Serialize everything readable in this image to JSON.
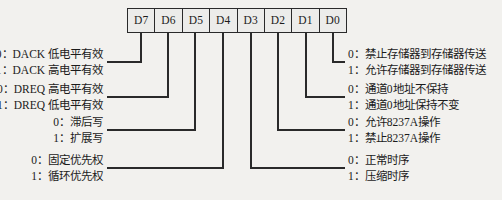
{
  "diagram": {
    "register": {
      "name": "command-register",
      "bits": [
        {
          "label": "D7"
        },
        {
          "label": "D6"
        },
        {
          "label": "D5"
        },
        {
          "label": "D4"
        },
        {
          "label": "D3"
        },
        {
          "label": "D2"
        },
        {
          "label": "D1"
        },
        {
          "label": "D0"
        }
      ]
    },
    "annotations_left": [
      {
        "bit": "D7",
        "line0": "0：DACK 低电平有效",
        "line1": "1：DACK 高电平有效"
      },
      {
        "bit": "D6",
        "line0": "0：DREQ 高电平有效",
        "line1": "1：DREQ 低电平有效"
      },
      {
        "bit": "D5",
        "line0": "0：滞后写",
        "line1": "1：扩展写"
      },
      {
        "bit": "D4",
        "line0": "0：固定优先权",
        "line1": "1：循环优先权"
      }
    ],
    "annotations_right": [
      {
        "bit": "D0",
        "line0": "0：禁止存储器到存储器传送",
        "line1": "1：允许存储器到存储器传送"
      },
      {
        "bit": "D1",
        "line0": "0：通道0地址不保持",
        "line1": "1：通道0地址保持不变"
      },
      {
        "bit": "D2",
        "line0": "0：允许8237A操作",
        "line1": "1：禁止8237A操作"
      },
      {
        "bit": "D3",
        "line0": "0：正常时序",
        "line1": "1：压缩时序"
      }
    ],
    "colors": {
      "background": "#f2f1ee",
      "ink": "#1b1b1b",
      "line": "#2a2a2a",
      "cell_fill": "#ececea"
    }
  }
}
